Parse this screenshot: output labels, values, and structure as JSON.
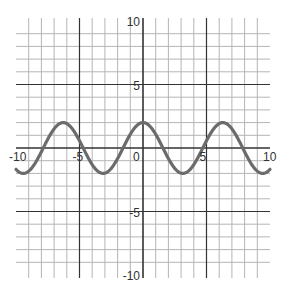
{
  "chart_data": {
    "type": "line",
    "title": "",
    "xlabel": "",
    "ylabel": "",
    "xlim": [
      -10,
      10
    ],
    "ylim": [
      -10,
      10
    ],
    "grid": true,
    "minor_grid_step": 1,
    "major_grid_step": 5,
    "x_tick_labels": [
      "-10",
      "-5",
      "0",
      "5",
      "10"
    ],
    "y_tick_labels": [
      "10",
      "5",
      "-5",
      "-10"
    ],
    "series": [
      {
        "name": "y = 2cos(x)",
        "function": "2*cos(x)",
        "amplitude": 2,
        "period": 6.283,
        "color": "#6b6b6b",
        "x_range": [
          -10,
          10
        ]
      }
    ]
  },
  "colors": {
    "minor_grid": "#b5b5b5",
    "major_grid": "#333333",
    "axis": "#333333",
    "curve": "#6b6b6b"
  }
}
